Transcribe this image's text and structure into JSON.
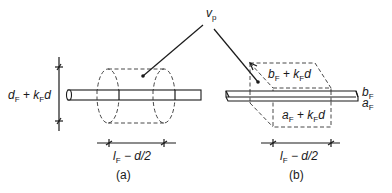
{
  "figure": {
    "vp_label": {
      "main": "v",
      "sub": "p"
    },
    "panel_a": {
      "caption": "(a)",
      "height_dim": {
        "d": "d",
        "F1": "F",
        "plus": " + ",
        "k": "k",
        "F2": "F",
        "d2": "d"
      },
      "length_dim": {
        "l": "l",
        "F": "F",
        "rest": " − d/2"
      }
    },
    "panel_b": {
      "caption": "(b)",
      "top_label": {
        "b": "b",
        "F1": "F",
        "plus": " + ",
        "k": "k",
        "F2": "F",
        "d": "d"
      },
      "front_label": {
        "a": "a",
        "F1": "F",
        "plus": " + ",
        "k": "k",
        "F2": "F",
        "d": "d"
      },
      "side_b": {
        "b": "b",
        "F": "F"
      },
      "side_a": {
        "a": "a",
        "F": "F"
      },
      "length_dim": {
        "l": "l",
        "F": "F",
        "rest": " − d/2"
      }
    }
  }
}
